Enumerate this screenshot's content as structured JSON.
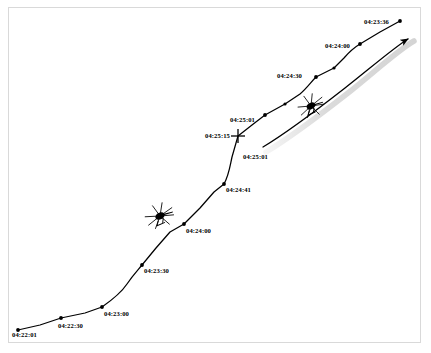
{
  "figure": {
    "background_color": "#ffffff",
    "frame_color": "#d9d9d9",
    "track_color": "#000000",
    "shadow_color": "#c8c8c8"
  },
  "labels": [
    {
      "name": "label-04-22-01",
      "text": "04:22:01",
      "x": 12,
      "y": 332
    },
    {
      "name": "label-04-22-30",
      "text": "04:22:30",
      "x": 58,
      "y": 323
    },
    {
      "name": "label-04-23-00",
      "text": "04:23:00",
      "x": 104,
      "y": 311
    },
    {
      "name": "label-04-23-30",
      "text": "04:23:30",
      "x": 144,
      "y": 268
    },
    {
      "name": "label-04-24-00-lower",
      "text": "04:24:00",
      "x": 186,
      "y": 228
    },
    {
      "name": "label-04-24-41",
      "text": "04:24:41",
      "x": 226,
      "y": 187
    },
    {
      "name": "label-04-25-01-mid",
      "text": "04:25:01",
      "x": 230,
      "y": 117
    },
    {
      "name": "label-04-25-15",
      "text": "04:25:15",
      "x": 205,
      "y": 133
    },
    {
      "name": "label-04-25-01-lower",
      "text": "04:25:01",
      "x": 243,
      "y": 154
    },
    {
      "name": "label-04-24-30",
      "text": "04:24:30",
      "x": 277,
      "y": 73
    },
    {
      "name": "label-04-24-00-upper",
      "text": "04:24:00",
      "x": 325,
      "y": 43
    },
    {
      "name": "label-04-23-36",
      "text": "04:23:36",
      "x": 364,
      "y": 19
    }
  ],
  "chart_data": {
    "type": "line",
    "xlabel": "",
    "ylabel": "",
    "series": [
      {
        "name": "primary-track",
        "style": "solid-with-dot-waypoints",
        "points": [
          {
            "x": 18,
            "y": 330,
            "time": "04:22:01",
            "marker": "dot"
          },
          {
            "x": 40,
            "y": 325,
            "marker": "none"
          },
          {
            "x": 61,
            "y": 318,
            "time": "04:22:30",
            "marker": "dot"
          },
          {
            "x": 85,
            "y": 313,
            "marker": "none"
          },
          {
            "x": 102,
            "y": 307,
            "time": "04:23:00",
            "marker": "dot"
          },
          {
            "x": 115,
            "y": 297,
            "marker": "none"
          },
          {
            "x": 127,
            "y": 284,
            "marker": "none"
          },
          {
            "x": 142,
            "y": 265,
            "time": "04:23:30",
            "marker": "dot"
          },
          {
            "x": 156,
            "y": 248,
            "marker": "none"
          },
          {
            "x": 170,
            "y": 232,
            "marker": "none"
          },
          {
            "x": 184,
            "y": 224,
            "time": "04:24:00",
            "marker": "dot"
          },
          {
            "x": 200,
            "y": 208,
            "marker": "none"
          },
          {
            "x": 214,
            "y": 192,
            "marker": "none"
          },
          {
            "x": 224,
            "y": 184,
            "time": "04:24:41",
            "marker": "dot"
          },
          {
            "x": 230,
            "y": 170,
            "marker": "none"
          },
          {
            "x": 232,
            "y": 157,
            "marker": "none"
          },
          {
            "x": 238,
            "y": 135,
            "time": "04:25:15",
            "marker": "cross"
          },
          {
            "x": 252,
            "y": 125,
            "marker": "none"
          },
          {
            "x": 265,
            "y": 115,
            "time": "04:25:01",
            "marker": "dot"
          },
          {
            "x": 285,
            "y": 104,
            "marker": "none"
          },
          {
            "x": 300,
            "y": 94,
            "marker": "none"
          },
          {
            "x": 316,
            "y": 77,
            "time": "04:24:30",
            "marker": "dot"
          },
          {
            "x": 334,
            "y": 68,
            "marker": "none"
          },
          {
            "x": 344,
            "y": 58,
            "marker": "none"
          },
          {
            "x": 360,
            "y": 44,
            "time": "04:24:00",
            "marker": "dot"
          },
          {
            "x": 380,
            "y": 32,
            "marker": "none"
          },
          {
            "x": 400,
            "y": 21,
            "time": "04:23:36",
            "marker": "dot"
          }
        ]
      },
      {
        "name": "secondary-track",
        "style": "solid-with-arrowhead",
        "points": [
          {
            "x": 263,
            "y": 147,
            "time": "04:25:01",
            "marker": "none"
          },
          {
            "x": 300,
            "y": 122,
            "marker": "none"
          },
          {
            "x": 340,
            "y": 92,
            "marker": "none"
          },
          {
            "x": 411,
            "y": 37,
            "marker": "arrowhead"
          }
        ]
      }
    ],
    "annotations": [
      {
        "name": "helicopter-symbol-lower",
        "type": "helicopter-icon",
        "x": 160,
        "y": 216,
        "rotation": -28
      },
      {
        "name": "helicopter-symbol-upper",
        "type": "helicopter-icon",
        "x": 311,
        "y": 106,
        "rotation": -28
      }
    ],
    "legend": null,
    "grid": false
  }
}
